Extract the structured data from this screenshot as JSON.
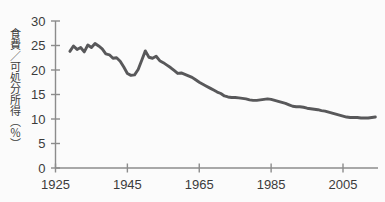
{
  "chart_data": {
    "type": "line",
    "title": "",
    "subtitle": "",
    "xlabel": "",
    "ylabel": "食費／可処分所得（％）",
    "xlim": [
      1925,
      2016
    ],
    "ylim": [
      0,
      30
    ],
    "xticks": [
      1925,
      1945,
      1965,
      1985,
      2005
    ],
    "xtick_labels": [
      "1925",
      "1945",
      "1965",
      "1985",
      "2005"
    ],
    "yticks": [
      0,
      5,
      10,
      15,
      20,
      25,
      30
    ],
    "ytick_labels": [
      "0",
      "5",
      "10",
      "15",
      "20",
      "25",
      "30"
    ],
    "grid": false,
    "legend": "none",
    "line_color": "#58585a",
    "axis_color": "#8c8c8c",
    "background_color": "#fbfbfb",
    "series": [
      {
        "name": "食費／可処分所得",
        "units": "%",
        "x": [
          1929,
          1930,
          1931,
          1932,
          1933,
          1934,
          1935,
          1936,
          1937,
          1938,
          1939,
          1940,
          1941,
          1942,
          1943,
          1944,
          1945,
          1946,
          1947,
          1948,
          1949,
          1950,
          1951,
          1952,
          1953,
          1954,
          1955,
          1956,
          1957,
          1958,
          1959,
          1960,
          1961,
          1962,
          1963,
          1964,
          1965,
          1966,
          1967,
          1968,
          1969,
          1970,
          1971,
          1972,
          1973,
          1974,
          1975,
          1976,
          1977,
          1978,
          1979,
          1980,
          1981,
          1982,
          1983,
          1984,
          1985,
          1986,
          1987,
          1988,
          1989,
          1990,
          1991,
          1992,
          1993,
          1994,
          1995,
          1996,
          1997,
          1998,
          1999,
          2000,
          2001,
          2002,
          2003,
          2004,
          2005,
          2006,
          2007,
          2008,
          2009,
          2010,
          2011,
          2012,
          2013,
          2014
        ],
        "y": [
          23.8,
          24.9,
          24.2,
          24.6,
          23.7,
          25.1,
          24.6,
          25.4,
          24.9,
          24.3,
          23.3,
          23.1,
          22.4,
          22.5,
          21.8,
          20.6,
          19.3,
          18.9,
          19.0,
          20.1,
          22.0,
          23.9,
          22.6,
          22.4,
          22.8,
          21.9,
          21.5,
          21.0,
          20.5,
          19.9,
          19.3,
          19.4,
          19.1,
          18.8,
          18.5,
          18.0,
          17.5,
          17.1,
          16.7,
          16.3,
          15.9,
          15.5,
          15.2,
          14.7,
          14.5,
          14.4,
          14.4,
          14.3,
          14.2,
          14.1,
          13.9,
          13.8,
          13.8,
          13.9,
          14.0,
          14.1,
          14.0,
          13.8,
          13.6,
          13.4,
          13.2,
          12.9,
          12.6,
          12.5,
          12.5,
          12.4,
          12.2,
          12.1,
          12.0,
          11.9,
          11.7,
          11.6,
          11.4,
          11.2,
          11.0,
          10.8,
          10.6,
          10.4,
          10.3,
          10.3,
          10.3,
          10.2,
          10.2,
          10.2,
          10.3,
          10.4
        ]
      }
    ]
  }
}
